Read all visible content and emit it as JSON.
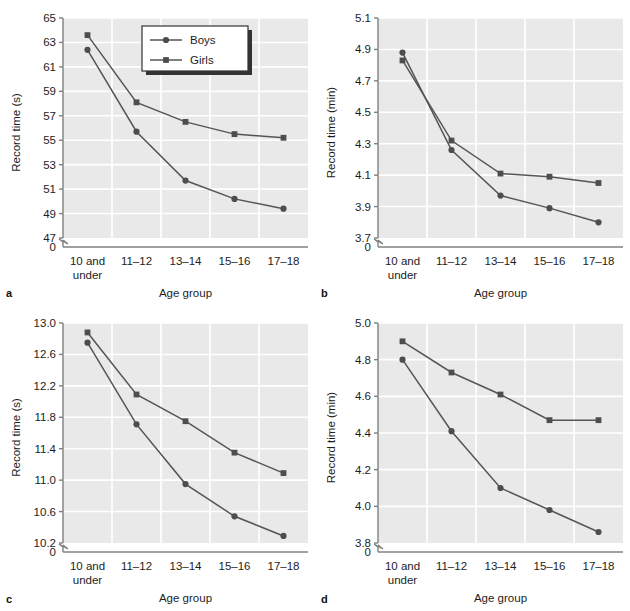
{
  "figure": {
    "panels": [
      "a",
      "b",
      "c",
      "d"
    ],
    "series_names": [
      "Boys",
      "Girls"
    ],
    "legend": {
      "present_in_panel": "a",
      "items": [
        {
          "label": "Boys",
          "marker": "circle"
        },
        {
          "label": "Girls",
          "marker": "square"
        }
      ]
    },
    "colors": {
      "plot_background": "#e9e9e9",
      "gridline": "#ffffff",
      "line": "#555555",
      "marker": "#4d4d4d",
      "axis": "#808080",
      "text": "#1d1d1d",
      "legend_background": "#ffffff",
      "legend_border": "#333333",
      "legend_shadow": "#333333"
    },
    "categories": [
      "10 and under",
      "11–12",
      "13–14",
      "15–16",
      "17–18"
    ],
    "category_lines": [
      [
        "10 and",
        "under"
      ],
      [
        "11–12"
      ],
      [
        "13–14"
      ],
      [
        "15–16"
      ],
      [
        "17–18"
      ]
    ],
    "xlabel": "Age group",
    "zero_tick": "0"
  },
  "chart_data": [
    {
      "panel": "a",
      "type": "line",
      "title": "",
      "xlabel": "Age group",
      "ylabel": "Record time (s)",
      "categories": [
        "10 and under",
        "11–12",
        "13–14",
        "15–16",
        "17–18"
      ],
      "yticks": [
        47,
        49,
        51,
        53,
        55,
        57,
        59,
        61,
        63,
        65
      ],
      "ytick_labels": [
        "47",
        "49",
        "51",
        "53",
        "55",
        "57",
        "59",
        "61",
        "63",
        "65"
      ],
      "ylim": [
        47,
        65
      ],
      "axis_break": true,
      "grid": true,
      "legend": "inside-top-right",
      "series": [
        {
          "name": "Boys",
          "marker": "circle",
          "values": [
            62.4,
            55.7,
            51.7,
            50.2,
            49.4
          ]
        },
        {
          "name": "Girls",
          "marker": "square",
          "values": [
            63.6,
            58.1,
            56.5,
            55.5,
            55.2
          ]
        }
      ]
    },
    {
      "panel": "b",
      "type": "line",
      "title": "",
      "xlabel": "Age group",
      "ylabel": "Record time (min)",
      "categories": [
        "10 and under",
        "11–12",
        "13–14",
        "15–16",
        "17–18"
      ],
      "yticks": [
        3.7,
        3.9,
        4.1,
        4.3,
        4.5,
        4.7,
        4.9,
        5.1
      ],
      "ytick_labels": [
        "3.7",
        "3.9",
        "4.1",
        "4.3",
        "4.5",
        "4.7",
        "4.9",
        "5.1"
      ],
      "ylim": [
        3.7,
        5.1
      ],
      "axis_break": true,
      "grid": true,
      "legend": "none",
      "series": [
        {
          "name": "Boys",
          "marker": "circle",
          "values": [
            4.88,
            4.26,
            3.97,
            3.89,
            3.8
          ]
        },
        {
          "name": "Girls",
          "marker": "square",
          "values": [
            4.83,
            4.32,
            4.11,
            4.09,
            4.05
          ]
        }
      ]
    },
    {
      "panel": "c",
      "type": "line",
      "title": "",
      "xlabel": "Age group",
      "ylabel": "Record time (s)",
      "categories": [
        "10 and under",
        "11–12",
        "13–14",
        "15–16",
        "17–18"
      ],
      "yticks": [
        10.2,
        10.6,
        11.0,
        11.4,
        11.8,
        12.2,
        12.6,
        13.0
      ],
      "ytick_labels": [
        "10.2",
        "10.6",
        "11.0",
        "11.4",
        "11.8",
        "12.2",
        "12.6",
        "13.0"
      ],
      "ylim": [
        10.2,
        13.0
      ],
      "axis_break": true,
      "grid": true,
      "legend": "none",
      "series": [
        {
          "name": "Boys",
          "marker": "circle",
          "values": [
            12.75,
            11.71,
            10.95,
            10.54,
            10.29
          ]
        },
        {
          "name": "Girls",
          "marker": "square",
          "values": [
            12.88,
            12.09,
            11.75,
            11.35,
            11.09
          ]
        }
      ]
    },
    {
      "panel": "d",
      "type": "line",
      "title": "",
      "xlabel": "Age group",
      "ylabel": "Record time (min)",
      "categories": [
        "10 and under",
        "11–12",
        "13–14",
        "15–16",
        "17–18"
      ],
      "yticks": [
        3.8,
        4.0,
        4.2,
        4.4,
        4.6,
        4.8,
        5.0
      ],
      "ytick_labels": [
        "3.8",
        "4.0",
        "4.2",
        "4.4",
        "4.6",
        "4.8",
        "5.0"
      ],
      "ylim": [
        3.8,
        5.0
      ],
      "axis_break": true,
      "grid": true,
      "legend": "none",
      "series": [
        {
          "name": "Boys",
          "marker": "circle",
          "values": [
            4.8,
            4.41,
            4.1,
            3.98,
            3.86
          ]
        },
        {
          "name": "Girls",
          "marker": "square",
          "values": [
            4.9,
            4.73,
            4.61,
            4.47,
            4.47
          ]
        }
      ]
    }
  ]
}
